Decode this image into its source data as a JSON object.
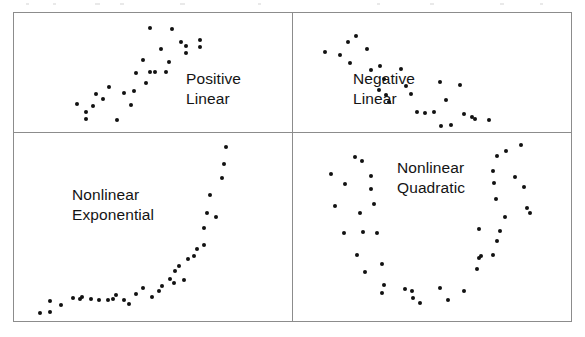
{
  "figure": {
    "title": "",
    "border_color": "#8c8c8c",
    "dot_color": "#111111",
    "background": "#ffffff"
  },
  "panels": [
    {
      "id": "positive-linear",
      "label_line1": "Positive",
      "label_line2": "Linear"
    },
    {
      "id": "negative-linear",
      "label_line1": "Negative",
      "label_line2": "Linear"
    },
    {
      "id": "nonlinear-exponential",
      "label_line1": "Nonlinear",
      "label_line2": "Exponential"
    },
    {
      "id": "nonlinear-quadratic",
      "label_line1": "Nonlinear",
      "label_line2": "Quadratic"
    }
  ],
  "chart_data": [
    {
      "type": "scatter",
      "title": "Positive Linear",
      "xlabel": "",
      "ylabel": "",
      "xlim": [
        0,
        278
      ],
      "ylim": [
        0,
        119
      ],
      "grid": false,
      "legend": "none",
      "annotations": [
        "Positive",
        "Linear"
      ],
      "points": [
        [
          79,
          93
        ],
        [
          72,
          106
        ],
        [
          82,
          81
        ],
        [
          95,
          74
        ],
        [
          103,
          107
        ],
        [
          110,
          80
        ],
        [
          120,
          78
        ],
        [
          89,
          86
        ],
        [
          63,
          91
        ],
        [
          72,
          99
        ],
        [
          117,
          92
        ],
        [
          132,
          70
        ],
        [
          122,
          60
        ],
        [
          129,
          47
        ],
        [
          136,
          59
        ],
        [
          141,
          59
        ],
        [
          152,
          59
        ],
        [
          147,
          36
        ],
        [
          155,
          49
        ],
        [
          167,
          29
        ],
        [
          136,
          15
        ],
        [
          158,
          16
        ],
        [
          172,
          33
        ],
        [
          172,
          40
        ],
        [
          186,
          27
        ],
        [
          186,
          34
        ]
      ]
    },
    {
      "type": "scatter",
      "title": "Negative Linear",
      "xlabel": "",
      "ylabel": "",
      "xlim": [
        0,
        278
      ],
      "ylim": [
        0,
        119
      ],
      "grid": false,
      "legend": "none",
      "annotations": [
        "Negative",
        "Linear"
      ],
      "points": [
        [
          32,
          39
        ],
        [
          47,
          42
        ],
        [
          55,
          29
        ],
        [
          57,
          50
        ],
        [
          63,
          23
        ],
        [
          74,
          36
        ],
        [
          78,
          57
        ],
        [
          87,
          53
        ],
        [
          86,
          77
        ],
        [
          93,
          82
        ],
        [
          96,
          89
        ],
        [
          91,
          66
        ],
        [
          108,
          56
        ],
        [
          113,
          73
        ],
        [
          118,
          81
        ],
        [
          124,
          99
        ],
        [
          132,
          100
        ],
        [
          141,
          99
        ],
        [
          147,
          69
        ],
        [
          153,
          87
        ],
        [
          158,
          112
        ],
        [
          167,
          72
        ],
        [
          171,
          101
        ],
        [
          179,
          104
        ],
        [
          182,
          106
        ],
        [
          196,
          107
        ],
        [
          148,
          113
        ]
      ]
    },
    {
      "type": "scatter",
      "title": "Nonlinear Exponential",
      "xlabel": "",
      "ylabel": "",
      "xlim": [
        0,
        278
      ],
      "ylim": [
        0,
        188
      ],
      "grid": false,
      "legend": "none",
      "annotations": [
        "Nonlinear",
        "Exponential"
      ],
      "points": [
        [
          26,
          180
        ],
        [
          36,
          179
        ],
        [
          36,
          168
        ],
        [
          47,
          172
        ],
        [
          59,
          165
        ],
        [
          66,
          166
        ],
        [
          68,
          164
        ],
        [
          77,
          166
        ],
        [
          85,
          167
        ],
        [
          94,
          167
        ],
        [
          99,
          166
        ],
        [
          102,
          162
        ],
        [
          110,
          167
        ],
        [
          115,
          171
        ],
        [
          122,
          161
        ],
        [
          129,
          155
        ],
        [
          138,
          164
        ],
        [
          145,
          158
        ],
        [
          148,
          153
        ],
        [
          156,
          146
        ],
        [
          160,
          150
        ],
        [
          161,
          138
        ],
        [
          165,
          133
        ],
        [
          170,
          147
        ],
        [
          174,
          126
        ],
        [
          180,
          123
        ],
        [
          183,
          116
        ],
        [
          190,
          112
        ],
        [
          190,
          95
        ],
        [
          193,
          80
        ],
        [
          196,
          62
        ],
        [
          202,
          84
        ],
        [
          208,
          45
        ],
        [
          210,
          31
        ],
        [
          212,
          14
        ]
      ]
    },
    {
      "type": "scatter",
      "title": "Nonlinear Quadratic",
      "xlabel": "",
      "ylabel": "",
      "xlim": [
        0,
        278
      ],
      "ylim": [
        0,
        188
      ],
      "grid": false,
      "legend": "none",
      "annotations": [
        "Nonlinear",
        "Quadratic"
      ],
      "points": [
        [
          38,
          41
        ],
        [
          52,
          51
        ],
        [
          42,
          73
        ],
        [
          62,
          24
        ],
        [
          69,
          28
        ],
        [
          78,
          43
        ],
        [
          78,
          56
        ],
        [
          81,
          71
        ],
        [
          67,
          80
        ],
        [
          51,
          100
        ],
        [
          70,
          99
        ],
        [
          84,
          100
        ],
        [
          64,
          122
        ],
        [
          72,
          139
        ],
        [
          89,
          131
        ],
        [
          91,
          152
        ],
        [
          89,
          160
        ],
        [
          112,
          156
        ],
        [
          119,
          158
        ],
        [
          120,
          165
        ],
        [
          127,
          170
        ],
        [
          147,
          155
        ],
        [
          155,
          167
        ],
        [
          171,
          158
        ],
        [
          184,
          136
        ],
        [
          186,
          125
        ],
        [
          188,
          123
        ],
        [
          186,
          96
        ],
        [
          200,
          122
        ],
        [
          204,
          108
        ],
        [
          207,
          98
        ],
        [
          212,
          84
        ],
        [
          203,
          66
        ],
        [
          201,
          50
        ],
        [
          200,
          38
        ],
        [
          204,
          23
        ],
        [
          213,
          18
        ],
        [
          228,
          12
        ],
        [
          222,
          44
        ],
        [
          231,
          54
        ],
        [
          234,
          75
        ],
        [
          237,
          80
        ]
      ]
    }
  ]
}
